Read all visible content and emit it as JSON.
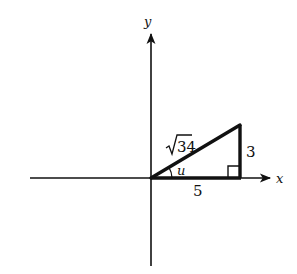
{
  "diagram": {
    "type": "right-triangle-on-coordinate-axes",
    "axes": {
      "x_label": "x",
      "y_label": "y"
    },
    "triangle": {
      "hypotenuse_label": "√34",
      "hypotenuse_radicand": "34",
      "opposite_label": "3",
      "adjacent_label": "5",
      "angle_label": "u",
      "right_angle_marker": true
    },
    "colors": {
      "stroke": "#111111",
      "background": "#ffffff"
    }
  }
}
